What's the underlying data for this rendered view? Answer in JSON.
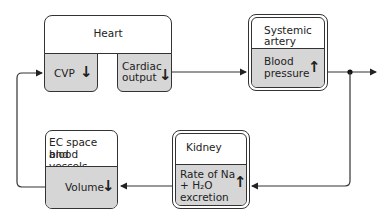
{
  "diagram": {
    "heart": {
      "title": "Heart",
      "cvp": {
        "label": "CVP",
        "direction": "↓"
      },
      "cardiac_output": {
        "label_line1": "Cardiac",
        "label_line2": "output",
        "direction": "↓"
      }
    },
    "systemic_artery": {
      "title_line1": "Systemic",
      "title_line2": "artery",
      "variable_line1": "Blood",
      "variable_line2": "pressure",
      "direction": "↑"
    },
    "kidney": {
      "title": "Kidney",
      "variable_line1": "Rate of Na",
      "variable_line2": "+ H₂O",
      "variable_line3": "excretion",
      "direction": "↑"
    },
    "ec_space": {
      "title_line1": "EC space and",
      "title_line2": "blood vessels",
      "variable": "Volume",
      "direction": "↓"
    },
    "colors": {
      "shade": "#d6d6d6",
      "line": "#333333"
    }
  }
}
